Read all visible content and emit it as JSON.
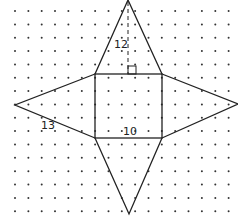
{
  "diagram": {
    "grid": {
      "x0": 15,
      "y0": 11,
      "spacing": 13.35,
      "cols": 17,
      "rows": 16,
      "dot_color": "#333333"
    },
    "square": {
      "x": 95,
      "y": 74,
      "width": 67,
      "height": 64
    },
    "vertices": {
      "top_apex": [
        128,
        0
      ],
      "left_tip": [
        15,
        105
      ],
      "right_tip": [
        238,
        104
      ],
      "bottom_tip": [
        129,
        214
      ]
    },
    "labels": {
      "slant_height": "12",
      "triangle_label": "13",
      "base_side": "10"
    },
    "line_color": "#222222"
  }
}
